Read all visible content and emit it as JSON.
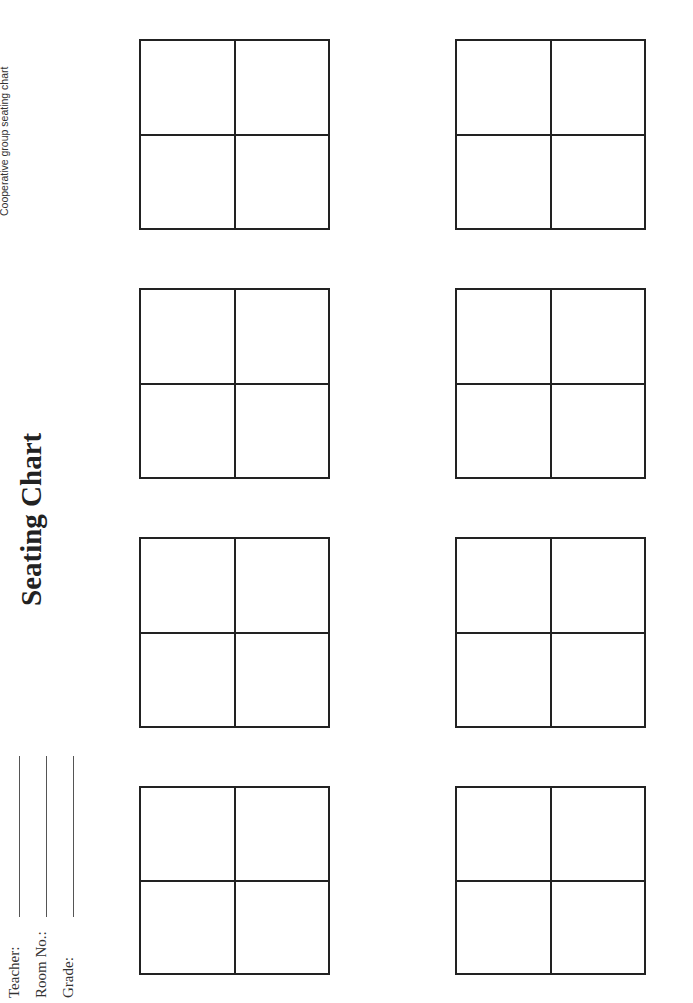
{
  "header": {
    "note": "Cooperative group seating chart"
  },
  "title": "Seating Chart",
  "fields": [
    {
      "label": "Teacher:",
      "value": ""
    },
    {
      "label": "Room No.:",
      "value": ""
    },
    {
      "label": "Grade:",
      "value": ""
    }
  ],
  "tables": {
    "count": 8,
    "seats_per_table": 4,
    "layout": "2 columns x 4 rows",
    "items": [
      {
        "seats": [
          "",
          "",
          "",
          ""
        ]
      },
      {
        "seats": [
          "",
          "",
          "",
          ""
        ]
      },
      {
        "seats": [
          "",
          "",
          "",
          ""
        ]
      },
      {
        "seats": [
          "",
          "",
          "",
          ""
        ]
      },
      {
        "seats": [
          "",
          "",
          "",
          ""
        ]
      },
      {
        "seats": [
          "",
          "",
          "",
          ""
        ]
      },
      {
        "seats": [
          "",
          "",
          "",
          ""
        ]
      },
      {
        "seats": [
          "",
          "",
          "",
          ""
        ]
      }
    ]
  },
  "colors": {
    "line": "#222222",
    "background": "#ffffff"
  }
}
